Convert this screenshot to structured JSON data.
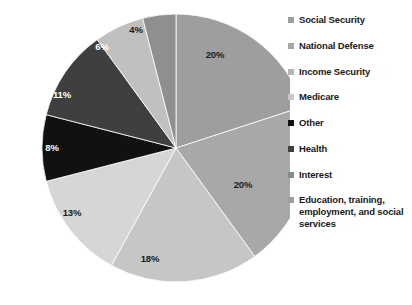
{
  "chart_data": {
    "type": "pie",
    "title": "",
    "subtitle": "",
    "xlabel": "",
    "ylabel": "",
    "legend_position": "right",
    "grid": false,
    "start_angle_deg": 0,
    "direction": "clockwise",
    "labels_inside_slices": true,
    "label_suffix": "%",
    "categories": [
      "Social Security",
      "National Defense",
      "Education, training, employment, and social services",
      "Interest",
      "Other",
      "Health",
      "Medicare",
      "Income Security"
    ],
    "values": [
      20,
      20,
      18,
      13,
      8,
      11,
      6,
      4
    ],
    "slices": [
      {
        "name": "Social Security",
        "value": 20,
        "label": "20%",
        "color": "#9e9e9e",
        "label_color": "#1a1a1a",
        "label_x": 215,
        "label_y": 58
      },
      {
        "name": "National Defense",
        "value": 20,
        "label": "20%",
        "color": "#a8a8a8",
        "label_color": "#1a1a1a",
        "label_x": 243,
        "label_y": 188
      },
      {
        "name": "Education, training, employment, and social services",
        "value": 18,
        "label": "18%",
        "color": "#c6c6c6",
        "label_color": "#1a1a1a",
        "label_x": 150,
        "label_y": 262
      },
      {
        "name": "Interest",
        "value": 13,
        "label": "13%",
        "color": "#d6d6d6",
        "label_color": "#1a1a1a",
        "label_x": 72,
        "label_y": 216
      },
      {
        "name": "Other",
        "value": 8,
        "label": "8%",
        "color": "#111111",
        "label_color": "#ffffff",
        "label_x": 52,
        "label_y": 151
      },
      {
        "name": "Health",
        "value": 11,
        "label": "11%",
        "color": "#3f3f3f",
        "label_color": "#ffffff",
        "label_x": 62,
        "label_y": 98
      },
      {
        "name": "Medicare",
        "value": 6,
        "label": "6%",
        "color": "#c0c0c0",
        "label_color": "#ffffff",
        "label_x": 102,
        "label_y": 50
      },
      {
        "name": "Income Security",
        "value": 4,
        "label": "4%",
        "color": "#8f8f8f",
        "label_color": "#1a1a1a",
        "label_x": 136,
        "label_y": 33
      }
    ]
  },
  "pie": {
    "center_x": 176,
    "center_y": 148,
    "radius": 134
  },
  "legend": {
    "items": [
      {
        "label": "Social Security",
        "color": "#9e9e9e"
      },
      {
        "label": "National Defense",
        "color": "#a8a8a8"
      },
      {
        "label": "Income Security",
        "color": "#b4b4b4"
      },
      {
        "label": "Medicare",
        "color": "#c8c8c8"
      },
      {
        "label": "Other",
        "color": "#111111"
      },
      {
        "label": "Health",
        "color": "#3f3f3f"
      },
      {
        "label": "Interest",
        "color": "#8a8a8a"
      },
      {
        "label": "Education, training, employment, and social services",
        "color": "#9e9e9e"
      }
    ]
  }
}
